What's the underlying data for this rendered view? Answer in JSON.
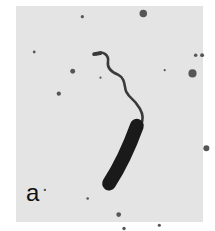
{
  "figure": {
    "panel_label": "a",
    "colors": {
      "background": "#e4e4e4",
      "cell": "#1a1a1a",
      "flagellum": "#3a3a3a",
      "particles": "#555555"
    }
  }
}
